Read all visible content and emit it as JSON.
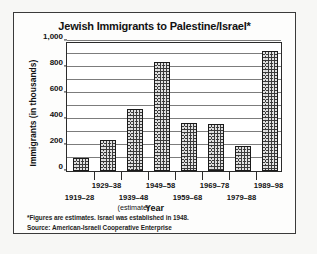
{
  "figure": {
    "title": "Jewish Immigrants to Palestine/Israel*",
    "footnotes": [
      "*Figures are estimates. Israel was established in 1948.",
      "Source: American-Israeli Cooperative Enterprise"
    ]
  },
  "chart_data": {
    "type": "bar",
    "title": "Jewish Immigrants to Palestine/Israel*",
    "xlabel": "Year",
    "ylabel": "Immigrants (in thousands)",
    "ylim": [
      0,
      1000
    ],
    "ytick_labels": [
      "1,000",
      "800",
      "600",
      "400",
      "200",
      "0"
    ],
    "ytick_values": [
      1000,
      800,
      600,
      400,
      200,
      0
    ],
    "gridlines": [
      1000,
      900,
      800,
      700,
      600,
      500,
      400,
      300,
      200,
      100,
      0
    ],
    "grid": true,
    "legend": "none",
    "categories": [
      "1919–28",
      "1929–38",
      "1939–48",
      "1949–58",
      "1959–68",
      "1969–78",
      "1979–88",
      "1989–98"
    ],
    "category_notes": [
      "",
      "",
      "(estimate)",
      "",
      "",
      "",
      "",
      ""
    ],
    "values": [
      100,
      235,
      480,
      840,
      370,
      360,
      190,
      920
    ],
    "units": "thousands"
  },
  "colors": {
    "frame_border": "#3a3a3a",
    "axis": "#2b2b2b",
    "gridline": "#7c7c7c",
    "bar_fill": "#3b3b3b",
    "text": "#121212",
    "page_background": "#f7f7f5",
    "plot_background": "#ffffff"
  }
}
